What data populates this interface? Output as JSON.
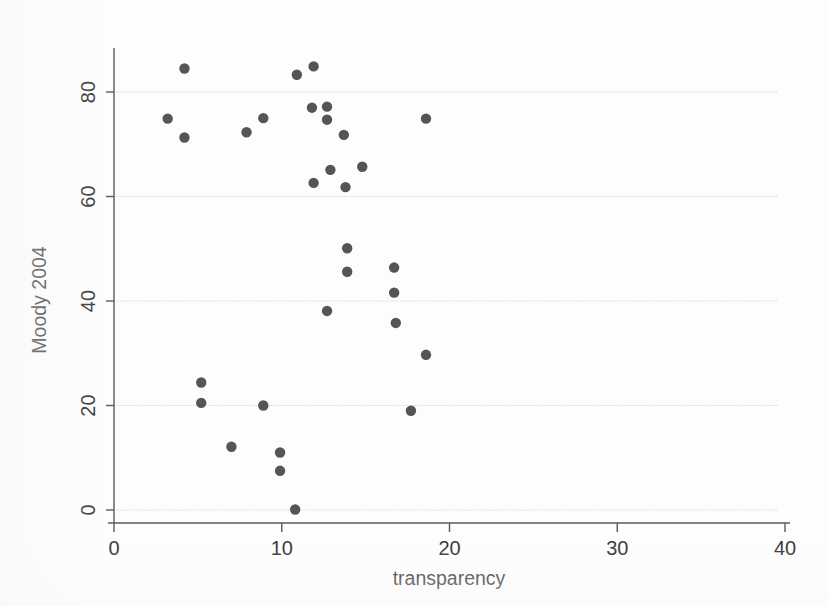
{
  "chart_data": {
    "type": "scatter",
    "title": "",
    "xlabel": "transparency",
    "ylabel": "Moody 2004",
    "xlim": [
      0,
      40
    ],
    "ylim": [
      0,
      88
    ],
    "xticks": [
      0,
      10,
      20,
      30,
      40
    ],
    "yticks": [
      0,
      20,
      40,
      60,
      80
    ],
    "xticklabels": [
      "0",
      "10",
      "20",
      "30",
      "40"
    ],
    "yticklabels": [
      "0",
      "20",
      "40",
      "60",
      "80"
    ],
    "grid": "horizontal",
    "gridlines_at_yticks": true,
    "legend": null,
    "marker": {
      "shape": "circle",
      "color": "#555558",
      "size": 5.2
    },
    "n_points": 31,
    "points": [
      {
        "x": 3.2,
        "y": 74.9
      },
      {
        "x": 4.2,
        "y": 84.5
      },
      {
        "x": 4.2,
        "y": 71.3
      },
      {
        "x": 5.2,
        "y": 24.4
      },
      {
        "x": 5.2,
        "y": 20.5
      },
      {
        "x": 7.0,
        "y": 12.1
      },
      {
        "x": 7.9,
        "y": 72.3
      },
      {
        "x": 8.9,
        "y": 75.0
      },
      {
        "x": 8.9,
        "y": 20.0
      },
      {
        "x": 9.9,
        "y": 11.0
      },
      {
        "x": 9.9,
        "y": 7.5
      },
      {
        "x": 10.8,
        "y": 0.1
      },
      {
        "x": 10.9,
        "y": 83.3
      },
      {
        "x": 11.8,
        "y": 77.0
      },
      {
        "x": 11.9,
        "y": 84.9
      },
      {
        "x": 11.9,
        "y": 62.6
      },
      {
        "x": 12.7,
        "y": 77.2
      },
      {
        "x": 12.7,
        "y": 74.7
      },
      {
        "x": 12.7,
        "y": 38.1
      },
      {
        "x": 12.9,
        "y": 65.1
      },
      {
        "x": 13.7,
        "y": 71.8
      },
      {
        "x": 13.8,
        "y": 61.8
      },
      {
        "x": 13.9,
        "y": 50.1
      },
      {
        "x": 13.9,
        "y": 45.6
      },
      {
        "x": 14.8,
        "y": 65.7
      },
      {
        "x": 16.7,
        "y": 46.4
      },
      {
        "x": 16.7,
        "y": 41.6
      },
      {
        "x": 16.8,
        "y": 35.8
      },
      {
        "x": 17.7,
        "y": 19.0
      },
      {
        "x": 18.6,
        "y": 74.9
      },
      {
        "x": 18.6,
        "y": 29.7
      }
    ]
  },
  "colors": {
    "marker": "#555558",
    "axis": "#5b5b5b",
    "grid": "#d3d3d3",
    "background": "#fdfdfd",
    "text": "#303030"
  }
}
